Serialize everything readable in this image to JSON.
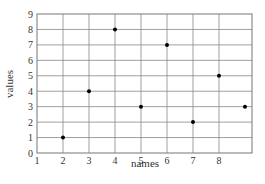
{
  "chart_data": {
    "type": "scatter",
    "title": "",
    "xlabel": "names",
    "ylabel": "values",
    "x": [
      2,
      3,
      4,
      5,
      6,
      7,
      8,
      9
    ],
    "values": [
      1,
      4,
      8,
      3,
      7,
      2,
      5,
      3
    ],
    "xticks": [
      1,
      2,
      3,
      4,
      5,
      6,
      7,
      8
    ],
    "yticks": [
      0,
      1,
      2,
      3,
      4,
      5,
      6,
      7,
      8,
      9
    ],
    "xlim": [
      1,
      9.27
    ],
    "ylim": [
      0,
      9
    ],
    "grid": true,
    "legend": null,
    "marker_color": "#000000"
  }
}
